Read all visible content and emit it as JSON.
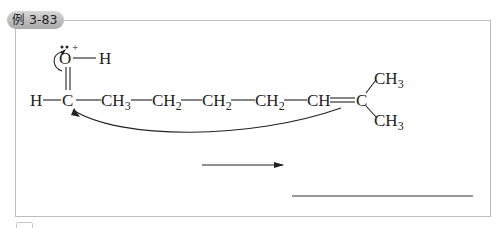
{
  "example_label": "例 3-83",
  "structure": {
    "oxygen": "O",
    "oxygen_charge": "+",
    "oh_hydrogen": "H",
    "left_hydrogen": "H",
    "carbonyl_carbon": "C",
    "chain": [
      {
        "main": "CH",
        "sub": "3"
      },
      {
        "main": "CH",
        "sub": "2"
      },
      {
        "main": "CH",
        "sub": "2"
      },
      {
        "main": "CH",
        "sub": "2"
      },
      {
        "main": "CH",
        "sub": ""
      }
    ],
    "terminal_carbon": "C",
    "methyl_top": {
      "main": "CH",
      "sub": "3"
    },
    "methyl_bottom": {
      "main": "CH",
      "sub": "3"
    }
  },
  "reaction_arrow": "→",
  "answer_blank": ""
}
